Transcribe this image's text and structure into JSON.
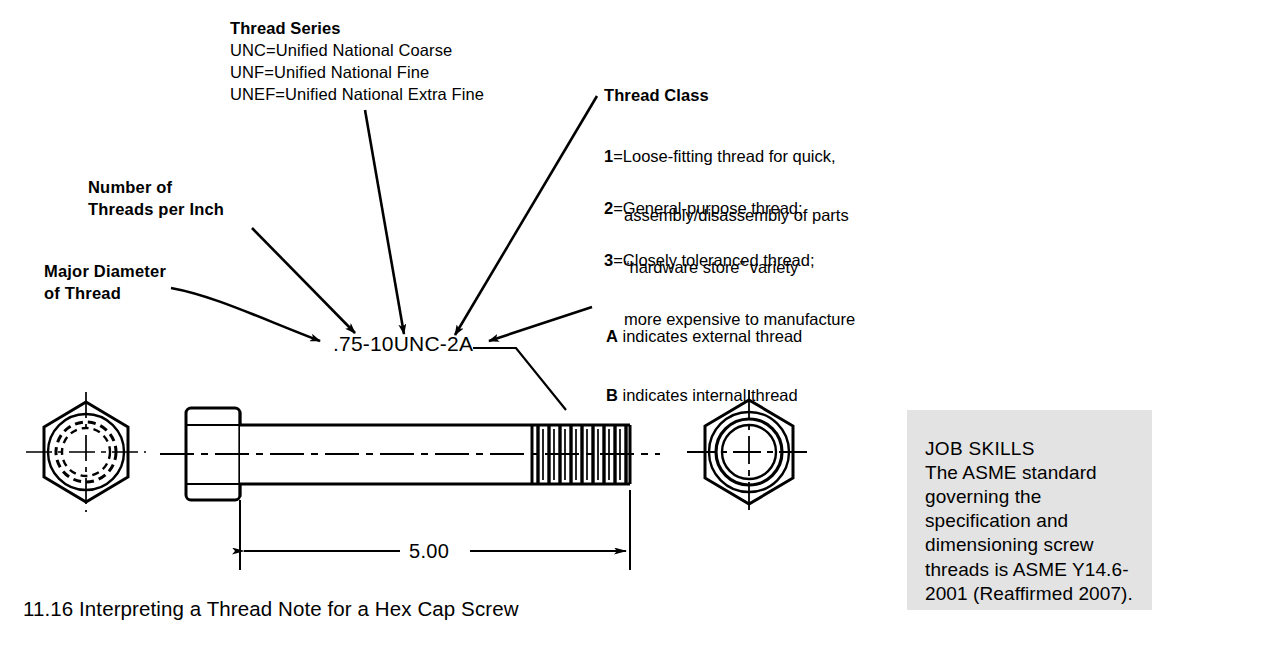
{
  "figure": {
    "caption": "11.16 Interpreting a Thread Note for a Hex Cap Screw",
    "thread_note": ".75-10UNC-2A",
    "dimension_label": "5.00"
  },
  "callouts": {
    "major_diameter": {
      "line1": "Major Diameter",
      "line2": "of Thread"
    },
    "threads_per_inch": {
      "line1": "Number of",
      "line2": "Threads per Inch"
    },
    "thread_series": {
      "heading": "Thread Series",
      "items": [
        "UNC=Unified National Coarse",
        "UNF=Unified National Fine",
        "UNEF=Unified National Extra Fine"
      ]
    },
    "thread_class": {
      "heading": "Thread Class",
      "items": [
        {
          "key": "1",
          "line1": "=Loose-fitting thread for quick,",
          "line2": "assembly/disassembly of parts"
        },
        {
          "key": "2",
          "line1": "=General-purpose thread;",
          "line2": "“hardware store” variety"
        },
        {
          "key": "3",
          "line1": "=Closely toleranced thread;",
          "line2": "more expensive to manufacture"
        }
      ]
    },
    "thread_form": {
      "a_key": "A",
      "a_text": " indicates external thread",
      "b_key": "B",
      "b_text": " indicates internal thread"
    }
  },
  "job_skills": {
    "title": "JOB SKILLS",
    "body": "The ASME standard governing the specification and dimensioning screw threads is ASME Y14.6-2001 (Reaffirmed 2007)."
  },
  "colors": {
    "ink": "#000000",
    "paper": "#ffffff",
    "sidebar_bg": "#e3e3e3"
  }
}
